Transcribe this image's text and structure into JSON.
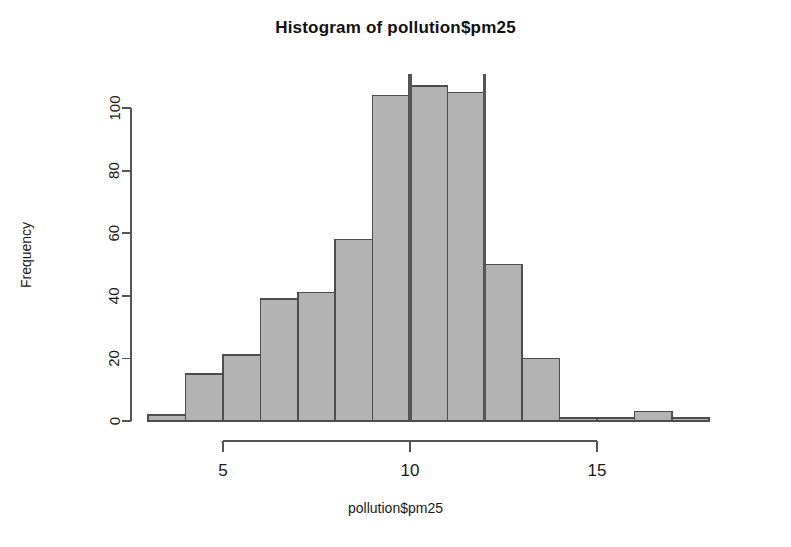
{
  "chart_data": {
    "type": "bar",
    "subtype": "histogram",
    "title": "Histogram of pollution$pm25",
    "xlabel": "pollution$pm25",
    "ylabel": "Frequency",
    "grid": false,
    "legend": null,
    "xlim": [
      3,
      19
    ],
    "ylim": [
      0,
      110
    ],
    "xticks": [
      5,
      10,
      15
    ],
    "xtick_labels": [
      "5",
      "10",
      "15"
    ],
    "yticks": [
      0,
      20,
      40,
      60,
      80,
      100
    ],
    "ytick_labels": [
      "0",
      "20",
      "40",
      "60",
      "80",
      "100"
    ],
    "bin_width": 1,
    "bin_edges": [
      3,
      4,
      5,
      6,
      7,
      8,
      9,
      10,
      11,
      12,
      13,
      14,
      15,
      16,
      17,
      18,
      19
    ],
    "categories": [
      "3-4",
      "4-5",
      "5-6",
      "6-7",
      "7-8",
      "8-9",
      "9-10",
      "10-11",
      "11-12",
      "12-13",
      "13-14",
      "14-15",
      "15-16",
      "16-17",
      "17-18",
      "18-19"
    ],
    "values": [
      2,
      15,
      21,
      39,
      41,
      58,
      104,
      107,
      105,
      50,
      20,
      1,
      1,
      3,
      1,
      0
    ],
    "annotations": [
      {
        "name": "reference-line-median",
        "type": "vline",
        "x": 10,
        "y_top": 111,
        "color": "#555555"
      },
      {
        "name": "reference-line-upper",
        "type": "vline",
        "x": 12,
        "y_top": 111,
        "color": "#555555"
      }
    ],
    "bar_fill": "#b3b3b3",
    "bar_stroke": "#4d4d4d",
    "axis_color": "#555555"
  }
}
